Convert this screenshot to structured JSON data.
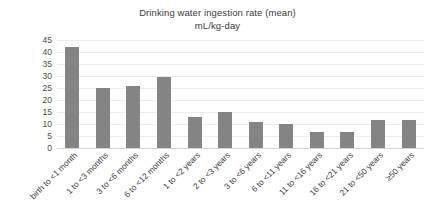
{
  "chart_data": {
    "type": "bar",
    "title": "Drinking water ingestion rate (mean)",
    "subtitle": "mL/kg-day",
    "xlabel": "",
    "ylabel": "",
    "ylim": [
      0,
      45
    ],
    "ytick_step": 5,
    "grid": true,
    "legend": "none",
    "bar_color": "#848484",
    "gridline_color": "#ececec",
    "categories": [
      "birth to <1 month",
      "1 to <3 months",
      "3 to <6 months",
      "6 to <12 months",
      "1 to <2 years",
      "2 to <3 years",
      "3 to <6 years",
      "6 to <11 years",
      "11 to <16 years",
      "16 to <21 years",
      "21 to <50 years",
      "≥50 years"
    ],
    "values": [
      42,
      25,
      26,
      29.5,
      13,
      15,
      11,
      10,
      6.5,
      6.5,
      11.5,
      11.5
    ],
    "yticks": [
      45,
      40,
      35,
      30,
      25,
      20,
      15,
      10,
      5,
      0
    ]
  }
}
